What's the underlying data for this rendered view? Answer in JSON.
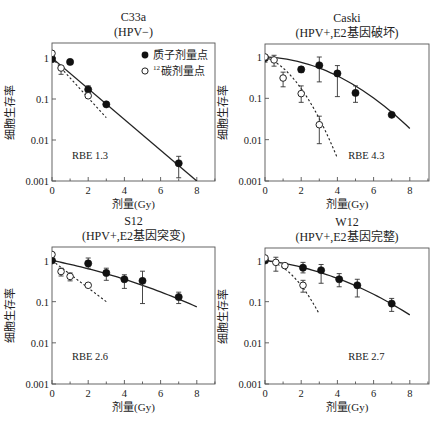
{
  "chart_data": [
    {
      "type": "scatter",
      "id": "c33a",
      "title": "C33a",
      "subtitle": "(HPV−)",
      "xlabel": "剂量(Gy)",
      "ylabel": "细胞生存率",
      "yscale": "log",
      "xlim": [
        0,
        9
      ],
      "ylim": [
        0.001,
        1.5
      ],
      "xticks": [
        0,
        2,
        4,
        6,
        8
      ],
      "yticks": [
        1,
        0.1,
        0.01,
        0.001
      ],
      "ytick_labels": [
        "1",
        "0.1",
        "0.01",
        "0.001"
      ],
      "annotation": "RBE 1.3",
      "annotation_pos": [
        1.1,
        0.0035
      ],
      "legend": [
        {
          "marker": "filled-circle",
          "label": "质子剂量点"
        },
        {
          "marker": "open-circle",
          "label": "¹²碳剂量点",
          "sup": "12",
          "text": "碳剂量点"
        }
      ],
      "series": [
        {
          "name": "质子剂量点",
          "marker": "filled",
          "points": [
            {
              "x": 0,
              "y": 0.95,
              "lo": 0.8,
              "hi": 1.1
            },
            {
              "x": 1,
              "y": 0.8
            },
            {
              "x": 2,
              "y": 0.17,
              "lo": 0.14,
              "hi": 0.21
            },
            {
              "x": 3,
              "y": 0.074
            },
            {
              "x": 7,
              "y": 0.0027,
              "lo": 0.0012,
              "hi": 0.004
            }
          ]
        },
        {
          "name": "¹²碳剂量点",
          "marker": "open",
          "points": [
            {
              "x": 0,
              "y": 1.3
            },
            {
              "x": 0.5,
              "y": 0.57,
              "lo": 0.4,
              "hi": 0.62
            },
            {
              "x": 2,
              "y": 0.12
            }
          ]
        }
      ],
      "fits": [
        {
          "style": "solid",
          "x": [
            0,
            8
          ],
          "y": [
            1.0,
            0.001
          ]
        },
        {
          "style": "dashed",
          "x": [
            0,
            3
          ],
          "y": [
            1.0,
            0.035
          ]
        }
      ]
    },
    {
      "type": "scatter",
      "id": "caski",
      "title": "Caski",
      "subtitle": "(HPV+,E2基因破坏)",
      "xlabel": "剂量(Gy)",
      "ylabel": "细胞生存率",
      "yscale": "log",
      "xlim": [
        0,
        9
      ],
      "ylim": [
        0.001,
        1.5
      ],
      "xticks": [
        0,
        2,
        4,
        6,
        8
      ],
      "yticks": [
        1,
        0.1,
        0.01,
        0.001
      ],
      "ytick_labels": [
        "1",
        "0.1",
        "0.01",
        "0.001"
      ],
      "annotation": "RBE 4.3",
      "annotation_pos": [
        4.6,
        0.0035
      ],
      "series": [
        {
          "name": "质子剂量点",
          "marker": "filled",
          "points": [
            {
              "x": 0,
              "y": 0.95,
              "lo": 0.75,
              "hi": 1.05
            },
            {
              "x": 2,
              "y": 0.5,
              "lo": 0.42,
              "hi": 0.58
            },
            {
              "x": 3,
              "y": 0.63,
              "lo": 0.25,
              "hi": 1.0
            },
            {
              "x": 4,
              "y": 0.4,
              "lo": 0.11,
              "hi": 0.62
            },
            {
              "x": 5,
              "y": 0.135,
              "lo": 0.08,
              "hi": 0.2
            },
            {
              "x": 7,
              "y": 0.04
            }
          ]
        },
        {
          "name": "¹²碳剂量点",
          "marker": "open",
          "points": [
            {
              "x": 0,
              "y": 1.0
            },
            {
              "x": 0.5,
              "y": 0.85,
              "lo": 0.6,
              "hi": 1.1
            },
            {
              "x": 1,
              "y": 0.31,
              "lo": 0.19,
              "hi": 0.43
            },
            {
              "x": 2,
              "y": 0.13,
              "lo": 0.08,
              "hi": 0.2
            },
            {
              "x": 3,
              "y": 0.023,
              "lo": 0.008,
              "hi": 0.037
            }
          ]
        }
      ],
      "fits": [
        {
          "style": "solid",
          "model": "lq",
          "x0": 0,
          "x1": 8,
          "alpha": 0.03,
          "beta": 0.0585
        },
        {
          "style": "dashed",
          "model": "lq",
          "x0": 0,
          "x1": 4,
          "alpha": 0.35,
          "beta": 0.265
        }
      ]
    },
    {
      "type": "scatter",
      "id": "s12",
      "title": "S12",
      "subtitle": "(HPV+,E2基因突变)",
      "xlabel": "剂量(Gy)",
      "ylabel": "细胞生存率",
      "yscale": "log",
      "xlim": [
        0,
        9
      ],
      "ylim": [
        0.001,
        1.5
      ],
      "xticks": [
        0,
        2,
        4,
        6,
        8
      ],
      "yticks": [
        1,
        0.1,
        0.01,
        0.001
      ],
      "ytick_labels": [
        "1",
        "0.1",
        "0.01",
        "0.001"
      ],
      "annotation": "RBE 2.6",
      "annotation_pos": [
        1.1,
        0.0038
      ],
      "series": [
        {
          "name": "质子剂量点",
          "marker": "filled",
          "points": [
            {
              "x": 0,
              "y": 1.0
            },
            {
              "x": 2,
              "y": 0.85,
              "lo": 0.65,
              "hi": 1.15
            },
            {
              "x": 3,
              "y": 0.5,
              "lo": 0.33,
              "hi": 0.65
            },
            {
              "x": 4,
              "y": 0.35,
              "lo": 0.21,
              "hi": 0.45
            },
            {
              "x": 5,
              "y": 0.32,
              "lo": 0.09,
              "hi": 0.55
            },
            {
              "x": 7,
              "y": 0.13,
              "lo": 0.09,
              "hi": 0.17
            }
          ]
        },
        {
          "name": "¹²碳剂量点",
          "marker": "open",
          "points": [
            {
              "x": 0,
              "y": 1.4
            },
            {
              "x": 0.5,
              "y": 0.54,
              "lo": 0.42,
              "hi": 0.65
            },
            {
              "x": 1,
              "y": 0.41,
              "lo": 0.32,
              "hi": 0.5
            },
            {
              "x": 2,
              "y": 0.25
            }
          ]
        }
      ],
      "fits": [
        {
          "style": "solid",
          "model": "lq",
          "x0": 0,
          "x1": 8,
          "alpha": 0.2,
          "beta": 0.0155
        },
        {
          "style": "dashed",
          "x": [
            0,
            3
          ],
          "y": [
            1.0,
            0.1
          ]
        }
      ]
    },
    {
      "type": "scatter",
      "id": "w12",
      "title": "W12",
      "subtitle": "(HPV+,E2基因完整)",
      "xlabel": "剂量(Gy)",
      "ylabel": "细胞生存率",
      "yscale": "log",
      "xlim": [
        0,
        9
      ],
      "ylim": [
        0.001,
        1.5
      ],
      "xticks": [
        0,
        2,
        4,
        6,
        8
      ],
      "yticks": [
        1,
        0.1,
        0.01,
        0.001
      ],
      "ytick_labels": [
        "1",
        "0.1",
        "0.01",
        "0.001"
      ],
      "annotation": "RBE 2.7",
      "annotation_pos": [
        4.6,
        0.0038
      ],
      "series": [
        {
          "name": "质子剂量点",
          "marker": "filled",
          "points": [
            {
              "x": 0,
              "y": 1.0
            },
            {
              "x": 2.1,
              "y": 0.67,
              "lo": 0.5,
              "hi": 0.9
            },
            {
              "x": 3.1,
              "y": 0.58,
              "lo": 0.28,
              "hi": 0.8
            },
            {
              "x": 4.1,
              "y": 0.35,
              "lo": 0.23,
              "hi": 0.48
            },
            {
              "x": 5.1,
              "y": 0.25,
              "lo": 0.13,
              "hi": 0.35
            },
            {
              "x": 7,
              "y": 0.09,
              "lo": 0.058,
              "hi": 0.12
            }
          ]
        },
        {
          "name": "¹²碳剂量点",
          "marker": "open",
          "points": [
            {
              "x": 0,
              "y": 1.15
            },
            {
              "x": 0.6,
              "y": 0.9,
              "lo": 0.55,
              "hi": 1.2
            },
            {
              "x": 1.1,
              "y": 0.75
            },
            {
              "x": 2.1,
              "y": 0.25,
              "lo": 0.17,
              "hi": 0.33
            }
          ]
        }
      ],
      "fits": [
        {
          "style": "solid",
          "model": "lq",
          "x0": 0,
          "x1": 8,
          "alpha": 0.12,
          "beta": 0.0325
        },
        {
          "style": "dashed",
          "model": "lq",
          "x0": 0,
          "x1": 3,
          "alpha": 0.1,
          "beta": 0.3
        }
      ]
    }
  ],
  "layout": {
    "panels": [
      {
        "left": 52,
        "top": 43,
        "width": 163,
        "height": 138,
        "y1": 58,
        "ymin_px": 181
      },
      {
        "left": 265,
        "top": 44,
        "width": 164,
        "height": 137,
        "y1": 57,
        "ymin_px": 181
      },
      {
        "left": 52,
        "top": 247,
        "width": 163,
        "height": 137,
        "y1": 260.5,
        "ymin_px": 384
      },
      {
        "left": 265,
        "top": 248,
        "width": 164,
        "height": 136,
        "y1": 260.5,
        "ymin_px": 384
      }
    ],
    "px_per_gy": 18.1
  }
}
